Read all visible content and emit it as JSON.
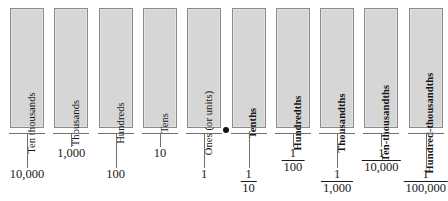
{
  "diagram": {
    "decimal_point": {
      "name": "decimal-point",
      "symbol": "."
    },
    "colors": {
      "box_fill": "#d6d6d6",
      "box_border": "#8a8a8a",
      "rule": "#6f6f6f",
      "text": "#1a1a1a",
      "background": "#ffffff"
    },
    "columns": [
      {
        "id": "ten-thousands",
        "label": "Ten thousands",
        "bold": false,
        "side": "whole",
        "value_type": "integer",
        "value": "10,000",
        "stem": "long",
        "value_row": "low"
      },
      {
        "id": "thousands",
        "label": "Thousands",
        "bold": false,
        "side": "whole",
        "value_type": "integer",
        "value": "1,000",
        "stem": "short",
        "value_row": "high"
      },
      {
        "id": "hundreds",
        "label": "Hundreds",
        "bold": false,
        "side": "whole",
        "value_type": "integer",
        "value": "100",
        "stem": "long",
        "value_row": "low"
      },
      {
        "id": "tens",
        "label": "Tens",
        "bold": false,
        "side": "whole",
        "value_type": "integer",
        "value": "10",
        "stem": "short",
        "value_row": "high"
      },
      {
        "id": "ones",
        "label": "Ones (or units)",
        "bold": false,
        "side": "whole",
        "value_type": "integer",
        "value": "1",
        "stem": "long",
        "value_row": "low"
      },
      {
        "id": "tenths",
        "label": "Tenths",
        "bold": true,
        "side": "decimal",
        "value_type": "fraction",
        "numerator": "1",
        "denominator": "10",
        "stem": "long",
        "value_row": "low"
      },
      {
        "id": "hundredths",
        "label": "Hundredths",
        "bold": true,
        "side": "decimal",
        "value_type": "fraction",
        "numerator": "1",
        "denominator": "100",
        "stem": "short",
        "value_row": "high"
      },
      {
        "id": "thousandths",
        "label": "Thousandths",
        "bold": true,
        "side": "decimal",
        "value_type": "fraction",
        "numerator": "1",
        "denominator": "1,000",
        "stem": "long",
        "value_row": "low"
      },
      {
        "id": "ten-thousandths",
        "label": "Ten-thousandths",
        "bold": true,
        "side": "decimal",
        "value_type": "fraction",
        "numerator": "1",
        "denominator": "10,000",
        "stem": "short",
        "value_row": "high"
      },
      {
        "id": "hundred-thousandths",
        "label": "Hundred-thousandths",
        "bold": true,
        "side": "decimal",
        "value_type": "fraction",
        "numerator": "1",
        "denominator": "100,000",
        "stem": "long",
        "value_row": "low"
      }
    ]
  }
}
